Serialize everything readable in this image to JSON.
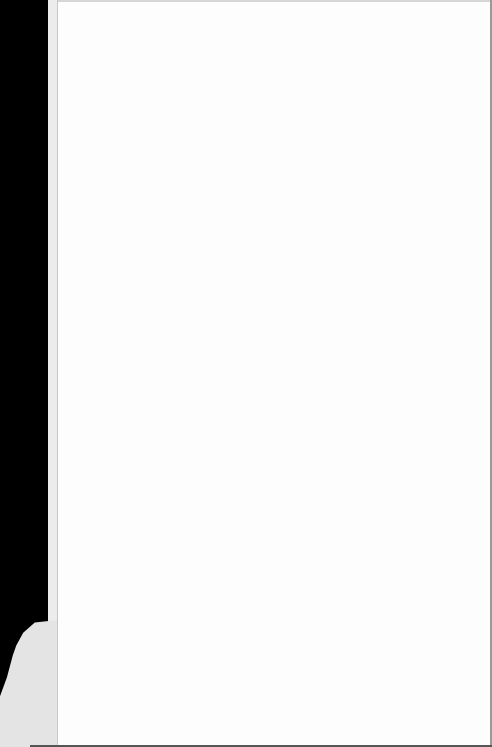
{
  "document": {
    "type": "scanned-page",
    "content": "",
    "colors": {
      "paper": "#fdfdfd",
      "scan_background": "#000000",
      "binding_strip": "#ececec"
    }
  }
}
